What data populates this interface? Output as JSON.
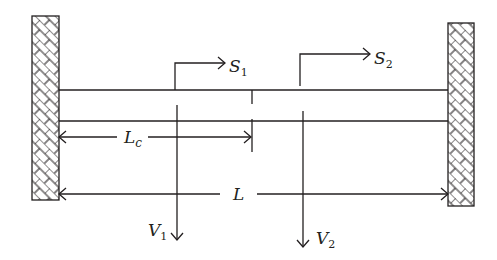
{
  "diagram": {
    "type": "clamped-clamped beam schematic",
    "colors": {
      "stroke": "#231f20",
      "background": "#ffffff"
    },
    "supports": [
      {
        "name": "left-fixed-support",
        "x": 32,
        "y": 16,
        "width": 27,
        "height": 184,
        "pattern": "hatched-brick"
      },
      {
        "name": "right-fixed-support",
        "x": 448,
        "y": 23,
        "width": 26,
        "height": 183,
        "pattern": "hatched-brick"
      }
    ],
    "beam": {
      "x1": 59,
      "x2": 448,
      "top_y": 90,
      "bottom_y": 121
    },
    "labels": {
      "s1": {
        "main": "S",
        "sub": "1"
      },
      "s2": {
        "main": "S",
        "sub": "2"
      },
      "v1": {
        "main": "V",
        "sub": "1"
      },
      "v2": {
        "main": "V",
        "sub": "2"
      },
      "lc": {
        "main": "L",
        "sub": "c"
      },
      "l": {
        "main": "L"
      }
    },
    "sensors": [
      {
        "name": "S1",
        "x": 175,
        "top_y": 63,
        "arrow_end_x": 225
      },
      {
        "name": "S2",
        "x": 300,
        "top_y": 54,
        "arrow_end_x": 370
      }
    ],
    "loads": [
      {
        "name": "V1",
        "x": 177,
        "start_y": 105,
        "tip_y": 240
      },
      {
        "name": "V2",
        "x": 303,
        "start_y": 111,
        "tip_y": 247
      }
    ],
    "dimensions": [
      {
        "name": "Lc",
        "y": 138,
        "x1": 59,
        "x2": 251
      },
      {
        "name": "L",
        "y": 194,
        "x1": 59,
        "x2": 448
      }
    ],
    "center_marker_x": 252
  }
}
